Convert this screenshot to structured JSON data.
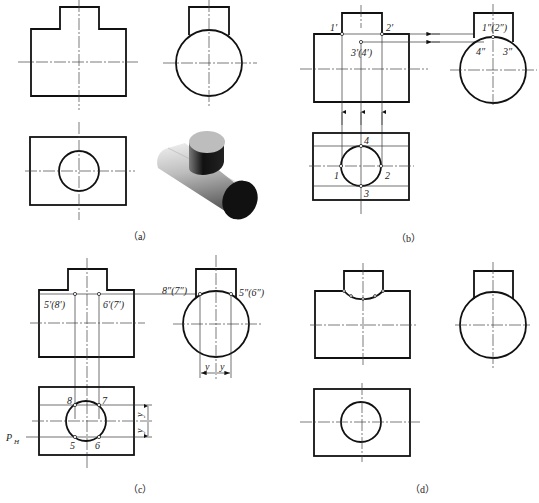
{
  "figure": {
    "colors": {
      "line": "#111111",
      "background": "#ffffff"
    },
    "panels": [
      {
        "id": "a",
        "caption": "（a）",
        "views": [
          "front-view",
          "side-view",
          "top-view",
          "isometric-3d-view"
        ]
      },
      {
        "id": "b",
        "caption": "（b）",
        "labels": {
          "p1_front": "1′",
          "p2_front": "2′",
          "p34_front": "3′(4′)",
          "p12_side": "1″(2″)",
          "p4_side": "4″",
          "p3_side": "3″",
          "p1_top": "1",
          "p2_top": "2",
          "p3_top": "3",
          "p4_top": "4"
        }
      },
      {
        "id": "c",
        "caption": "（c）",
        "labels": {
          "p58_front": "5′(8′)",
          "p67_front": "6′(7′)",
          "p87_side": "8″(7″)",
          "p56_side": "5″(6″)",
          "p8_top": "8",
          "p7_top": "7",
          "p5_top": "5",
          "p6_top": "6",
          "dim_y_left": "y",
          "dim_y_right": "y",
          "dim_y_top": "y",
          "dim_y_bottom": "y",
          "plane": "P",
          "plane_sub": "H"
        }
      },
      {
        "id": "d",
        "caption": "（d）",
        "views": [
          "front-view-with-intersection-curve",
          "side-view",
          "top-view"
        ]
      }
    ]
  }
}
